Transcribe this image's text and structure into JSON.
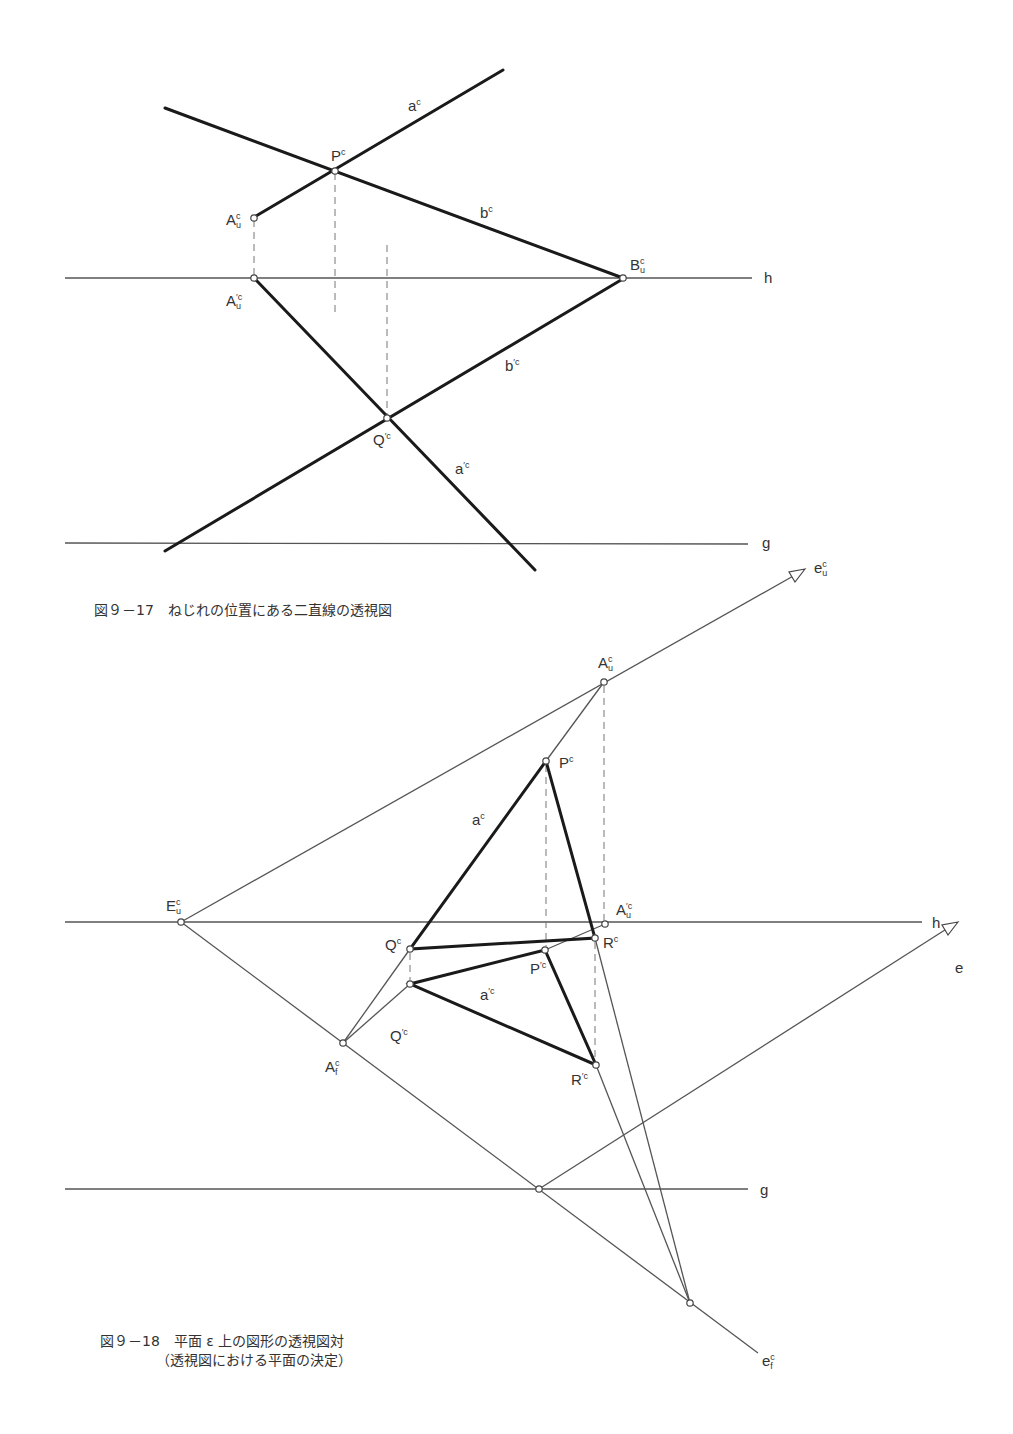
{
  "figure1": {
    "caption": "図９－17　ねじれの位置にある二直線の透視図",
    "labels": {
      "a": {
        "base": "a",
        "sup": "c"
      },
      "P": {
        "base": "P",
        "sup": "c"
      },
      "b": {
        "base": "b",
        "sup": "c"
      },
      "Au": {
        "base": "A",
        "sup": "c",
        "sub": "u"
      },
      "Bu": {
        "base": "B",
        "sup": "c",
        "sub": "u"
      },
      "Au_prime": {
        "base": "A",
        "sup": "′c",
        "sub": "u"
      },
      "b_prime": {
        "base": "b",
        "sup": "′c"
      },
      "Q_prime": {
        "base": "Q",
        "sup": "′c"
      },
      "a_prime": {
        "base": "a",
        "sup": "′c"
      },
      "h": "h",
      "g": "g"
    }
  },
  "figure2": {
    "caption_line1": "図９－18　平面 ε 上の図形の透視図対",
    "caption_line2": "（透視図における平面の決定）",
    "labels": {
      "eu": {
        "base": "e",
        "sup": "c",
        "sub": "u"
      },
      "Au": {
        "base": "A",
        "sup": "c",
        "sub": "u"
      },
      "P": {
        "base": "P",
        "sup": "c"
      },
      "a": {
        "base": "a",
        "sup": "c"
      },
      "Eu": {
        "base": "E",
        "sup": "c",
        "sub": "u"
      },
      "Au_prime": {
        "base": "A",
        "sup": "′c",
        "sub": "u"
      },
      "h": "h",
      "Q": {
        "base": "Q",
        "sup": "c"
      },
      "R": {
        "base": "R",
        "sup": "c"
      },
      "P_prime": {
        "base": "P",
        "sup": "′c"
      },
      "e": "e",
      "a_prime": {
        "base": "a",
        "sup": "′c"
      },
      "Q_prime": {
        "base": "Q",
        "sup": "′c"
      },
      "Af": {
        "base": "A",
        "sup": "c",
        "sub": "f"
      },
      "R_prime": {
        "base": "R",
        "sup": "′c"
      },
      "g": "g",
      "ef": {
        "base": "e",
        "sup": "c",
        "sub": "f"
      }
    }
  }
}
